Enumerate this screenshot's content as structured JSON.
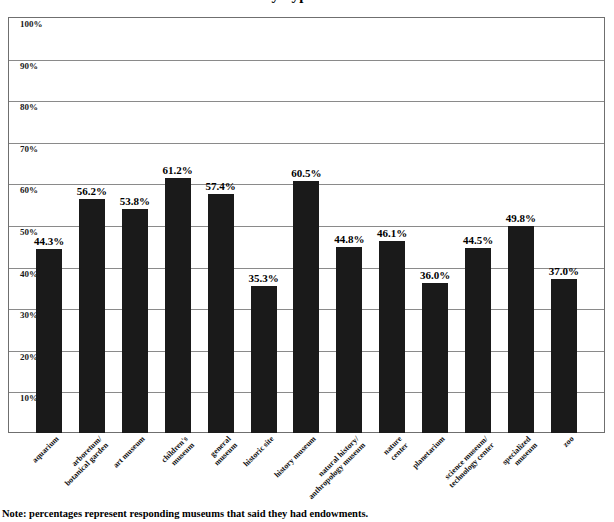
{
  "title": "Percent of Museums with Endowments by Type",
  "note": "Note: percentages represent responding museums that said they had endowments.",
  "axis": {
    "y_ticks": [
      "10%",
      "20%",
      "30%",
      "40%",
      "50%",
      "60%",
      "70%",
      "80%",
      "90%",
      "100%"
    ]
  },
  "colors": {
    "bar": "#1a1a1a",
    "gridline": "#8a8a8a",
    "frame": "#6f6f6f",
    "background": "#ffffff",
    "text": "#000000"
  },
  "chart_data": {
    "type": "bar",
    "title": "Percent of Museums with Endowments by Type",
    "xlabel": "",
    "ylabel": "",
    "ylim": [
      0,
      100
    ],
    "grid": true,
    "legend": "none",
    "categories": [
      "aquarium",
      "arboretum/ botanical garden",
      "art museum",
      "children's museum",
      "general museum",
      "historic site",
      "history museum",
      "natural history/ anthropology museum",
      "nature center",
      "planetarium",
      "science museum/ technology center",
      "specialized museum",
      "zoo"
    ],
    "category_lines": [
      [
        "aquarium"
      ],
      [
        "arboretum/",
        "botanical garden"
      ],
      [
        "art museum"
      ],
      [
        "children's",
        "museum"
      ],
      [
        "general",
        "museum"
      ],
      [
        "historic site"
      ],
      [
        "history museum"
      ],
      [
        "natural history/",
        "anthropology museum"
      ],
      [
        "nature",
        "center"
      ],
      [
        "planetarium"
      ],
      [
        "science museum/",
        "technology center"
      ],
      [
        "specialized",
        "museum"
      ],
      [
        "zoo"
      ]
    ],
    "values": [
      44.3,
      56.2,
      53.8,
      61.2,
      57.4,
      35.3,
      60.5,
      44.8,
      46.1,
      36.0,
      44.5,
      49.8,
      37.0
    ],
    "value_labels": [
      "44.3%",
      "56.2%",
      "53.8%",
      "61.2%",
      "57.4%",
      "35.3%",
      "60.5%",
      "44.8%",
      "46.1%",
      "36.0%",
      "44.5%",
      "49.8%",
      "37.0%"
    ]
  }
}
